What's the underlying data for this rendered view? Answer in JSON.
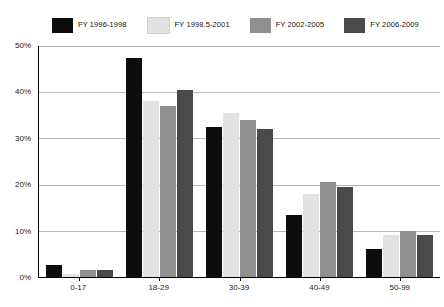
{
  "chart_data": {
    "type": "bar",
    "title": "",
    "subtitle": "",
    "xlabel": "",
    "ylabel": "",
    "categories": [
      "0-17",
      "18-29",
      "30-39",
      "40-49",
      "50-99"
    ],
    "series": [
      {
        "name": "FY 1996-1998",
        "color": "#0d0d0d",
        "values": [
          2.7,
          47.5,
          32.5,
          13.5,
          6.0
        ]
      },
      {
        "name": "FY 1998.5-2001",
        "color": "#e2e2e2",
        "values": [
          0.7,
          38.0,
          35.5,
          18.0,
          9.0
        ]
      },
      {
        "name": "FY 2002-2005",
        "color": "#909090",
        "values": [
          1.5,
          37.0,
          34.0,
          20.5,
          10.0
        ]
      },
      {
        "name": "FY 2006-2009",
        "color": "#4a4a4a",
        "values": [
          1.5,
          40.5,
          32.0,
          19.5,
          9.0
        ]
      }
    ],
    "ylim": [
      0,
      50
    ],
    "y_ticks": [
      0,
      10,
      20,
      30,
      40,
      50
    ],
    "y_tick_labels": [
      "0%",
      "10%",
      "20%",
      "30%",
      "40%",
      "50%"
    ],
    "grid": true,
    "legend_position": "top"
  }
}
